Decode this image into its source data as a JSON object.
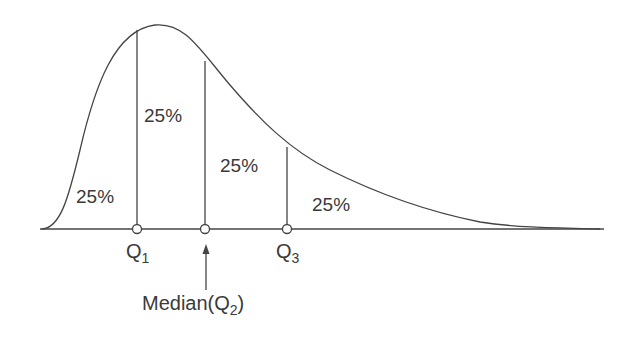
{
  "diagram": {
    "areas": [
      {
        "label": "25%",
        "region": "below Q1"
      },
      {
        "label": "25%",
        "region": "Q1 to median"
      },
      {
        "label": "25%",
        "region": "median to Q3"
      },
      {
        "label": "25%",
        "region": "above Q3"
      }
    ],
    "markers": {
      "q1": {
        "main": "Q",
        "sub": "1"
      },
      "q3": {
        "main": "Q",
        "sub": "3"
      },
      "median": {
        "prefix": "Median(Q",
        "sub": "2",
        "suffix": ")"
      }
    },
    "colors": {
      "line": "#444444",
      "text": "#3a3a3a",
      "background": "#ffffff"
    }
  }
}
